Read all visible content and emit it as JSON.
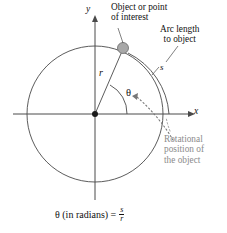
{
  "figure": {
    "type": "diagram",
    "background_color": "#ffffff",
    "line_color": "#3a3a3a",
    "gray_text_color": "#8b8b8b",
    "object_dot_color": "#a0a0a0"
  },
  "axes": {
    "y_label": "y",
    "x_label": "x",
    "origin_label": ""
  },
  "labels": {
    "object": "Object or point\nof interest",
    "arc_length": "Arc length\nto object",
    "rotational": "Rotational\nposition of\nthe object",
    "radius": "r",
    "angle": "θ",
    "arc": "s"
  },
  "formula": {
    "lhs": "θ (in radians) =",
    "numerator": "s",
    "denominator": "r"
  },
  "geometry": {
    "center_x": 95,
    "center_y": 114,
    "radius": 68,
    "arc_radius": 74,
    "object_angle_deg": 61,
    "theta_arc_radius": 32
  }
}
